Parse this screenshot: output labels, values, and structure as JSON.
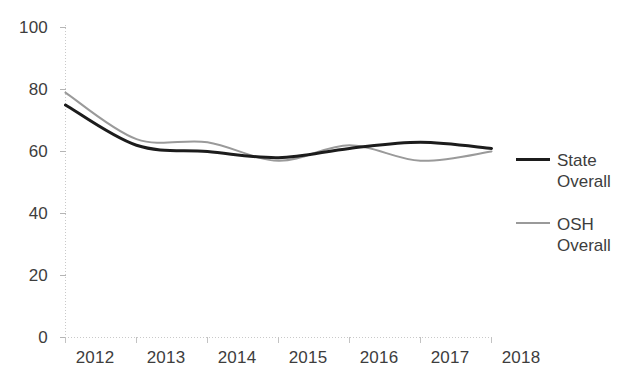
{
  "chart_data": {
    "type": "line",
    "title": "",
    "xlabel": "",
    "ylabel": "",
    "categories": [
      "2012",
      "2013",
      "2014",
      "2015",
      "2016",
      "2017",
      "2018"
    ],
    "x": [
      2012,
      2013,
      2014,
      2015,
      2016,
      2017,
      2018
    ],
    "xlim": [
      2012,
      2018
    ],
    "ylim": [
      0,
      100
    ],
    "yticks": [
      0,
      20,
      40,
      60,
      80,
      100
    ],
    "ytick_labels": [
      "0",
      "20",
      "40",
      "60",
      "80",
      "100"
    ],
    "xtick_labels": [
      "2012",
      "2013",
      "2014",
      "2015",
      "2016",
      "2017",
      "2018"
    ],
    "grid": false,
    "legend_position": "right",
    "series": [
      {
        "name": "State Overall",
        "label_line1": "State",
        "label_line2": "Overall",
        "color": "#1c1c1c",
        "style": "solid",
        "width": 3,
        "values": [
          75,
          62,
          60,
          58,
          61,
          63,
          61
        ]
      },
      {
        "name": "OSH Overall",
        "label_line1": "OSH",
        "label_line2": "Overall",
        "color": "#9a9a9a",
        "style": "solid",
        "width": 2,
        "values": [
          79,
          64,
          63,
          57,
          62,
          57,
          60
        ]
      }
    ]
  },
  "axis": {
    "y_tick_0": "0",
    "y_tick_20": "20",
    "y_tick_40": "40",
    "y_tick_60": "60",
    "y_tick_80": "80",
    "y_tick_100": "100",
    "x_tick_2012": "2012",
    "x_tick_2013": "2013",
    "x_tick_2014": "2014",
    "x_tick_2015": "2015",
    "x_tick_2016": "2016",
    "x_tick_2017": "2017",
    "x_tick_2018": "2018"
  },
  "legend": {
    "entries": [
      {
        "label": "State\nOverall",
        "swatch": "solid-dark-line"
      },
      {
        "label": "OSH\nOverall",
        "swatch": "solid-gray-line"
      }
    ]
  },
  "colors": {
    "state_line": "#1c1c1c",
    "osh_line": "#9a9a9a",
    "axis": "#c9c9c9",
    "text": "#3d3d3d",
    "background": "#ffffff"
  }
}
